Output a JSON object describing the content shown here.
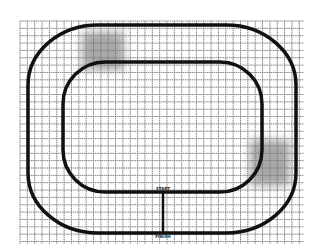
{
  "diagram": {
    "type": "track-map",
    "background": "#ffffff",
    "grid": {
      "x0": 20,
      "y0": 21,
      "x1": 304,
      "y1": 244,
      "spacing": 7.35,
      "color": "#7a7a7a"
    },
    "tracks": {
      "outer": {
        "x": 28,
        "y": 25,
        "w": 268,
        "h": 208,
        "rx": 70,
        "ry": 60,
        "stroke": "#111111",
        "stroke_width": 3.5
      },
      "inner": {
        "x": 63,
        "y": 62,
        "w": 199,
        "h": 130,
        "rx": 42,
        "ry": 42,
        "stroke": "#111111",
        "stroke_width": 3.5
      },
      "connector": {
        "x": 163,
        "y1": 192,
        "y2": 232,
        "stroke_width": 2.5
      }
    },
    "shaded_regions": [
      {
        "name": "upper-left-zone",
        "x": 82,
        "y": 32,
        "w": 42,
        "h": 38,
        "color": "#9a9a9a"
      },
      {
        "name": "lower-right-zone",
        "x": 250,
        "y": 140,
        "w": 40,
        "h": 46,
        "color": "#9a9a9a"
      }
    ],
    "labels": {
      "start": "START",
      "finish": "FINISH"
    }
  }
}
